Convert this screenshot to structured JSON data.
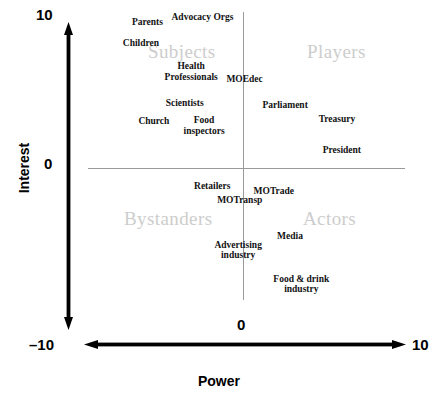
{
  "chart_data": {
    "type": "scatter",
    "title": "",
    "xlabel": "Power",
    "ylabel": "Interest",
    "xlim": [
      -10,
      10
    ],
    "ylim": [
      -10,
      10
    ],
    "grid": true,
    "legend": "none",
    "x_ticks": [
      "-10",
      "0",
      "10"
    ],
    "y_ticks": [
      "-10",
      "0",
      "10"
    ],
    "quadrant_labels": [
      {
        "name": "Subjects",
        "quadrant": "top-left",
        "x": -4.5,
        "y": 7.6
      },
      {
        "name": "Players",
        "quadrant": "top-right",
        "x": 4.6,
        "y": 7.6
      },
      {
        "name": "Bystanders",
        "quadrant": "bottom-left",
        "x": -3.9,
        "y": -2.4
      },
      {
        "name": "Actors",
        "quadrant": "bottom-right",
        "x": 4.2,
        "y": -2.4
      }
    ],
    "points": [
      {
        "label": "Parents",
        "x": -5.9,
        "y": 9.0
      },
      {
        "label": "Advocacy Orgs",
        "x": -2.5,
        "y": 9.3
      },
      {
        "label": "Children",
        "x": -6.3,
        "y": 7.7
      },
      {
        "label": "Health\nProfessionals",
        "x": -3.2,
        "y": 5.9
      },
      {
        "label": "MOEdec",
        "x": 0.1,
        "y": 5.5
      },
      {
        "label": "Scientists",
        "x": -3.6,
        "y": 4.0
      },
      {
        "label": "Parliament",
        "x": 2.6,
        "y": 3.9
      },
      {
        "label": "Church",
        "x": -5.5,
        "y": 2.9
      },
      {
        "label": "Food\ninspectors",
        "x": -2.4,
        "y": 2.6
      },
      {
        "label": "Treasury",
        "x": 5.8,
        "y": 3.0
      },
      {
        "label": "President",
        "x": 6.1,
        "y": 1.1
      },
      {
        "label": "Retailers",
        "x": -1.9,
        "y": -1.1
      },
      {
        "label": "MOTrade",
        "x": 1.9,
        "y": -1.4
      },
      {
        "label": "MOTransp",
        "x": -0.2,
        "y": -2.0
      },
      {
        "label": "Media",
        "x": 2.9,
        "y": -4.2
      },
      {
        "label": "Advertising\nindustry",
        "x": -0.3,
        "y": -5.1
      },
      {
        "label": "Food & drink\nindustry",
        "x": 3.6,
        "y": -7.2
      }
    ]
  },
  "axes": {
    "y_title": "Interest",
    "x_title": "Power",
    "y_max_label": "10",
    "y_zero_label": "0",
    "y_min_label": "–10",
    "x_zero_label": "0",
    "x_max_label": "10"
  },
  "icons": {
    "y_axis_arrow": "double-headed-vertical-arrow-icon",
    "x_axis_arrow": "double-headed-horizontal-arrow-icon"
  },
  "colors": {
    "axis": "#000000",
    "gridline": "#9a9a9a",
    "quadrant_label": "#cdcdcd",
    "point_label": "#111111",
    "background": "#ffffff"
  },
  "layout": {
    "origin_px": {
      "x": 243,
      "y": 168
    },
    "px_per_unit": {
      "x": 16.2,
      "y": 16.2
    },
    "quadrant_px": [
      {
        "left": 148,
        "top": 41
      },
      {
        "left": 307,
        "top": 41
      },
      {
        "left": 124,
        "top": 208
      },
      {
        "left": 303,
        "top": 208
      }
    ]
  }
}
